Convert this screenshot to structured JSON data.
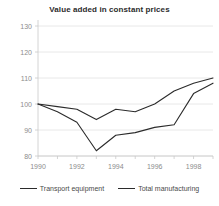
{
  "chart_data": {
    "type": "line",
    "title": "Value added in constant prices",
    "xlabel": "",
    "ylabel": "",
    "x": [
      1990,
      1991,
      1992,
      1993,
      1994,
      1995,
      1996,
      1997,
      1998,
      1999
    ],
    "xtick_labels": [
      "1990",
      "1992",
      "1994",
      "1996",
      "1998"
    ],
    "xtick_values": [
      1990,
      1992,
      1994,
      1996,
      1998
    ],
    "ytick_labels": [
      "130",
      "120",
      "110",
      "100",
      "90",
      "80"
    ],
    "ytick_values": [
      130,
      120,
      110,
      100,
      90,
      80
    ],
    "xlim": [
      1990,
      1999
    ],
    "ylim": [
      80,
      130
    ],
    "grid": true,
    "legend_position": "bottom",
    "series": [
      {
        "name": "Transport equipment",
        "color": "#2b2b2b",
        "values": [
          100,
          97,
          93,
          82,
          88,
          89,
          91,
          92,
          104,
          108
        ]
      },
      {
        "name": "Total manufacturing",
        "color": "#2b2b2b",
        "values": [
          100,
          99,
          98,
          94,
          98,
          97,
          100,
          105,
          108,
          110
        ]
      }
    ]
  },
  "legend": {
    "items": [
      {
        "label": "Transport equipment"
      },
      {
        "label": "Total manufacturing"
      }
    ]
  }
}
